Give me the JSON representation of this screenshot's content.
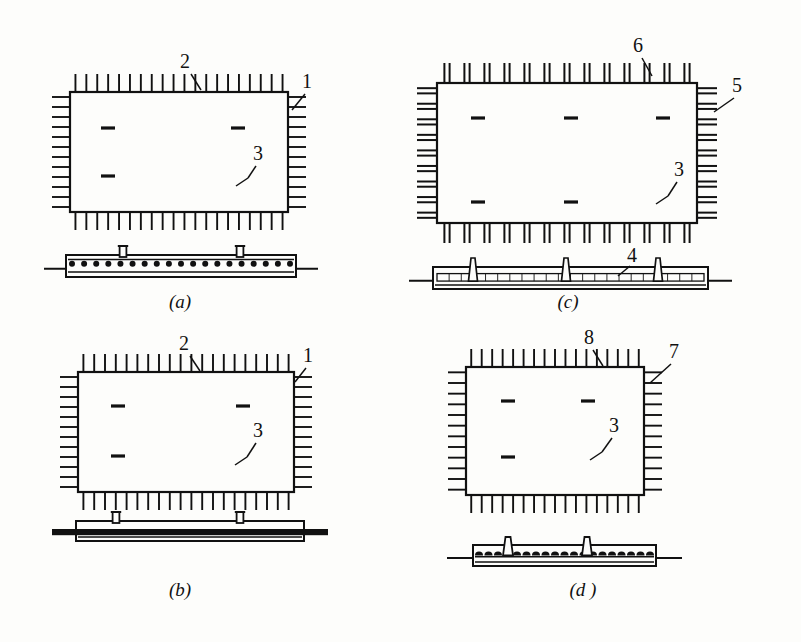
{
  "figure": {
    "background_color": "#fdfdfb",
    "line_color": "#111111",
    "width": 801,
    "height": 642
  },
  "panels": [
    {
      "id": "a",
      "caption": "(a)",
      "caption_x": 180,
      "caption_y": 308,
      "plan": {
        "x": 70,
        "y": 92,
        "w": 218,
        "h": 120,
        "tick_style": "single",
        "top_ticks": 20,
        "bottom_ticks": 20,
        "left_ticks": 12,
        "right_ticks": 12,
        "tick_len": 18,
        "inner_marks": [
          {
            "x": 108,
            "y": 128
          },
          {
            "x": 238,
            "y": 128
          },
          {
            "x": 108,
            "y": 176
          }
        ]
      },
      "section": {
        "x": 66,
        "y": 255,
        "w": 230,
        "h": 22,
        "fill_style": "dots",
        "dot_count": 19,
        "studs": [
          {
            "x": 123
          },
          {
            "x": 240
          }
        ],
        "baseline_extend": 22
      },
      "callouts": [
        {
          "label": "2",
          "tx": 185,
          "ty": 68,
          "lx1": 191,
          "ly1": 74,
          "lx2": 201,
          "ly2": 90
        },
        {
          "label": "1",
          "tx": 307,
          "ty": 88,
          "lx1": 305,
          "ly1": 94,
          "lx2": 292,
          "ly2": 110
        },
        {
          "label": "3",
          "tx": 258,
          "ty": 160,
          "lx1": 256,
          "ly1": 166,
          "lx2": 248,
          "ly2": 178,
          "kind": "short-kink"
        }
      ]
    },
    {
      "id": "b",
      "caption": "(b)",
      "caption_x": 180,
      "caption_y": 596,
      "plan": {
        "x": 78,
        "y": 372,
        "w": 216,
        "h": 120,
        "tick_style": "single",
        "top_ticks": 20,
        "bottom_ticks": 20,
        "left_ticks": 12,
        "right_ticks": 12,
        "tick_len": 18,
        "inner_marks": [
          {
            "x": 118,
            "y": 406
          },
          {
            "x": 243,
            "y": 406
          },
          {
            "x": 118,
            "y": 456
          }
        ]
      },
      "section": {
        "x": 76,
        "y": 521,
        "w": 228,
        "h": 20,
        "fill_style": "solid-bar",
        "studs": [
          {
            "x": 116
          },
          {
            "x": 240
          }
        ],
        "baseline_extend": 24
      },
      "callouts": [
        {
          "label": "2",
          "tx": 184,
          "ty": 350,
          "lx1": 190,
          "ly1": 356,
          "lx2": 200,
          "ly2": 371
        },
        {
          "label": "1",
          "tx": 308,
          "ty": 362,
          "lx1": 306,
          "ly1": 368,
          "lx2": 295,
          "ly2": 382
        },
        {
          "label": "3",
          "tx": 258,
          "ty": 437,
          "lx1": 256,
          "ly1": 443,
          "lx2": 247,
          "ly2": 457,
          "kind": "short-kink"
        }
      ]
    },
    {
      "id": "c",
      "caption": "(c)",
      "caption_x": 568,
      "caption_y": 308,
      "plan": {
        "x": 437,
        "y": 83,
        "w": 260,
        "h": 140,
        "tick_style": "double",
        "top_ticks": 13,
        "bottom_ticks": 13,
        "left_ticks": 9,
        "right_ticks": 9,
        "tick_len": 20,
        "inner_marks": [
          {
            "x": 478,
            "y": 118
          },
          {
            "x": 571,
            "y": 118
          },
          {
            "x": 663,
            "y": 118
          },
          {
            "x": 478,
            "y": 202
          },
          {
            "x": 571,
            "y": 202
          }
        ]
      },
      "section": {
        "x": 433,
        "y": 267,
        "w": 275,
        "h": 22,
        "fill_style": "rail",
        "rail_ticks": 22,
        "studs": [
          {
            "x": 473
          },
          {
            "x": 566
          },
          {
            "x": 658
          }
        ],
        "baseline_extend": 24
      },
      "callouts": [
        {
          "label": "6",
          "tx": 638,
          "ty": 52,
          "lx1": 642,
          "ly1": 58,
          "lx2": 652,
          "ly2": 76
        },
        {
          "label": "5",
          "tx": 737,
          "ty": 92,
          "lx1": 734,
          "ly1": 98,
          "lx2": 714,
          "ly2": 112
        },
        {
          "label": "3",
          "tx": 679,
          "ty": 176,
          "lx1": 677,
          "ly1": 182,
          "lx2": 668,
          "ly2": 196,
          "kind": "short-kink"
        },
        {
          "label": "4",
          "tx": 632,
          "ty": 262,
          "lx1": 630,
          "ly1": 266,
          "lx2": 618,
          "ly2": 276
        }
      ]
    },
    {
      "id": "d",
      "caption": "(d )",
      "caption_x": 583,
      "caption_y": 596,
      "plan": {
        "x": 466,
        "y": 367,
        "w": 178,
        "h": 128,
        "tick_style": "single",
        "top_ticks": 17,
        "bottom_ticks": 17,
        "left_ticks": 12,
        "right_ticks": 12,
        "tick_len": 18,
        "inner_marks": [
          {
            "x": 508,
            "y": 401
          },
          {
            "x": 588,
            "y": 401
          },
          {
            "x": 508,
            "y": 457
          }
        ]
      },
      "section": {
        "x": 473,
        "y": 545,
        "w": 183,
        "h": 21,
        "fill_style": "domes",
        "dome_count": 19,
        "studs": [
          {
            "x": 508
          },
          {
            "x": 587
          }
        ],
        "baseline_extend": 26
      },
      "callouts": [
        {
          "label": "8",
          "tx": 589,
          "ty": 344,
          "lx1": 593,
          "ly1": 350,
          "lx2": 603,
          "ly2": 366
        },
        {
          "label": "7",
          "tx": 674,
          "ty": 358,
          "lx1": 671,
          "ly1": 364,
          "lx2": 650,
          "ly2": 383
        },
        {
          "label": "3",
          "tx": 614,
          "ty": 432,
          "lx1": 612,
          "ly1": 438,
          "lx2": 602,
          "ly2": 452,
          "kind": "short-kink"
        }
      ]
    }
  ],
  "legend_numbers": [
    "1",
    "2",
    "3",
    "4",
    "5",
    "6",
    "7",
    "8"
  ]
}
